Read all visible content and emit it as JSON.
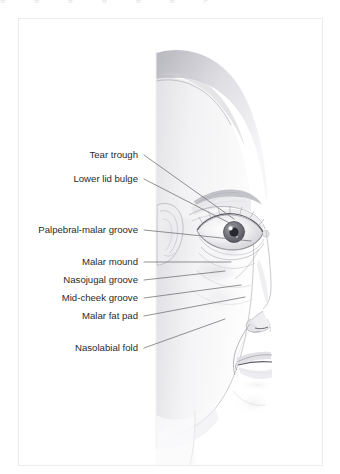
{
  "page": {
    "background_color": "#ffffff",
    "width": 340,
    "height": 474
  },
  "clipped_header": {
    "visible": true,
    "fragments": [
      "g",
      "g",
      "g",
      "g",
      "g",
      "g",
      "p"
    ]
  },
  "figure": {
    "panel": {
      "border_color": "#ececec",
      "background_color": "#ffffff",
      "x": 18,
      "y": 18,
      "width": 305,
      "height": 448
    },
    "illustration": {
      "name": "half-face-anatomy-illustration",
      "description": "Grayscale pencil-style rendering of the right half of a female face, vertically bisected, showing eye, ear, nose, cheek and mouth",
      "style": "grayscale-pencil",
      "skin_light": "#fcfcfc",
      "skin_mid": "#e9e9ec",
      "shadow": "#c9c9cf",
      "line_color": "#6e6e73"
    },
    "leader_line_color": "#6e6e73",
    "labels": [
      {
        "id": "tear-trough",
        "text": "Tear trough",
        "text_y": 136,
        "leader": {
          "x1": 125,
          "y1": 136,
          "x2": 215,
          "y2": 200
        }
      },
      {
        "id": "lower-lid-bulge",
        "text": "Lower lid bulge",
        "text_y": 160,
        "leader": {
          "x1": 125,
          "y1": 160,
          "x2": 226,
          "y2": 212
        }
      },
      {
        "id": "palpebral-malar-groove",
        "text": "Palpebral-malar groove",
        "text_y": 211,
        "leader": {
          "x1": 125,
          "y1": 211,
          "x2": 232,
          "y2": 222
        }
      },
      {
        "id": "malar-mound",
        "text": "Malar mound",
        "text_y": 243,
        "leader": {
          "x1": 125,
          "y1": 243,
          "x2": 212,
          "y2": 243
        }
      },
      {
        "id": "nasojugal-groove",
        "text": "Nasojugal groove",
        "text_y": 261,
        "leader": {
          "x1": 125,
          "y1": 261,
          "x2": 206,
          "y2": 252
        }
      },
      {
        "id": "mid-cheek-groove",
        "text": "Mid-cheek groove",
        "text_y": 279,
        "leader": {
          "x1": 125,
          "y1": 279,
          "x2": 222,
          "y2": 266
        }
      },
      {
        "id": "malar-fat-pad",
        "text": "Malar fat pad",
        "text_y": 297,
        "leader": {
          "x1": 125,
          "y1": 297,
          "x2": 226,
          "y2": 278
        }
      },
      {
        "id": "nasolabial-fold",
        "text": "Nasolabial fold",
        "text_y": 329,
        "leader": {
          "x1": 125,
          "y1": 329,
          "x2": 206,
          "y2": 300
        }
      }
    ]
  }
}
